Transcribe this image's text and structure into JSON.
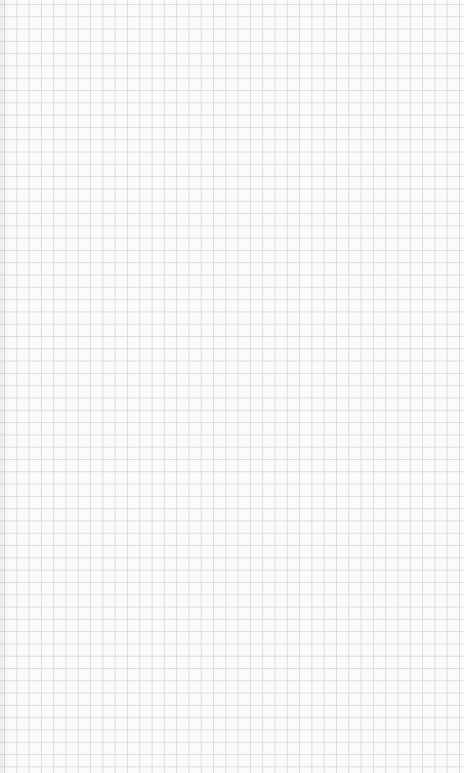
{
  "page": {
    "type": "grid-paper",
    "background_color": "#fbfbfb",
    "grid_line_color": "#dcdcdc",
    "grid_spacing_px": 12.3
  }
}
